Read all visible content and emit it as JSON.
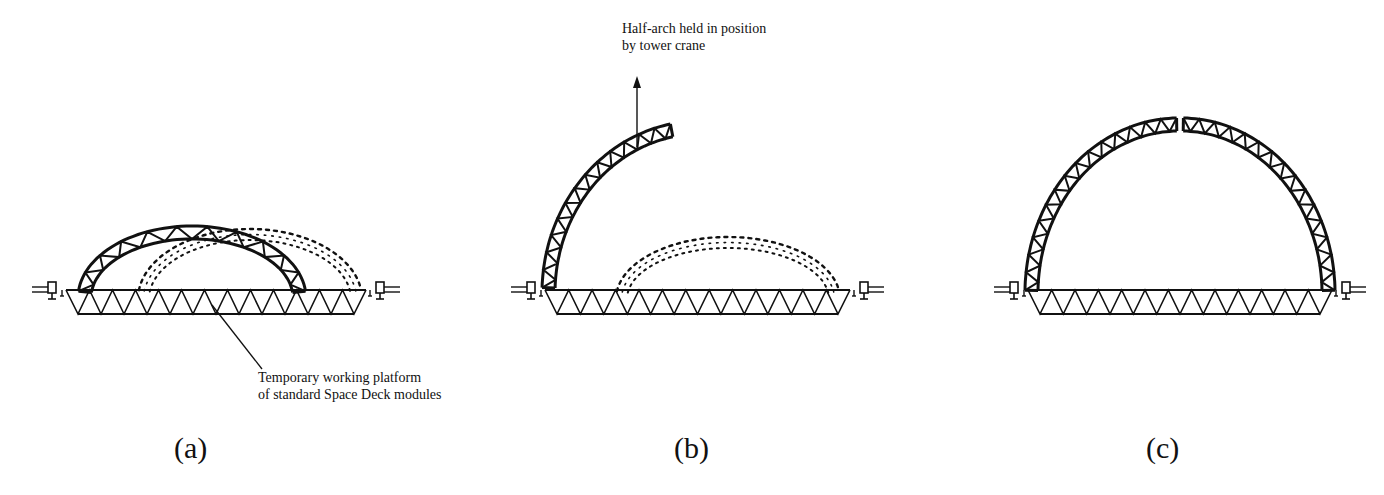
{
  "figure": {
    "panels": [
      {
        "id": "a",
        "label": "(a)",
        "annotation": [
          "Temporary working platform",
          "of standard Space Deck modules"
        ]
      },
      {
        "id": "b",
        "label": "(b)",
        "annotation": [
          "Half-arch held in position",
          "by tower crane"
        ]
      },
      {
        "id": "c",
        "label": "(c)",
        "annotation": []
      }
    ],
    "platform": {
      "modules": 12
    },
    "colors": {
      "line": "#111111",
      "background": "#ffffff"
    }
  }
}
